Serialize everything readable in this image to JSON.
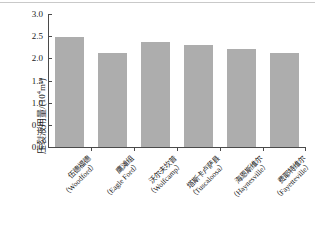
{
  "chart_data": {
    "type": "bar",
    "title": "",
    "xlabel": "",
    "ylabel": "压裂液用量/(10⁴m³)",
    "ylabel_main": "压裂液用量/(10",
    "ylabel_sup": "4",
    "ylabel_tail": "m³)",
    "ylim": [
      0.0,
      3.0
    ],
    "ytick_labels": [
      "0.0",
      "0.5",
      "1.0",
      "1.5",
      "2.0",
      "2.5",
      "3.0"
    ],
    "ytick_values": [
      0.0,
      0.5,
      1.0,
      1.5,
      2.0,
      2.5,
      3.0
    ],
    "grid": false,
    "legend": "none",
    "bar_color": "#adadad",
    "axis_color": "#4a4a4a",
    "categories": [
      "伍德福德（Woodford）",
      "鹰滩组（Eagle Ford）",
      "沃尔夫坎普（Wolfcamp）",
      "塔斯卡卢萨县（Tuscaloosa）",
      "海恩斯维尔（Haynesville）",
      "费耶特维尔（Fayetteville）"
    ],
    "categories_cn": [
      "伍德福德",
      "鹰滩组",
      "沃尔夫坎普",
      "塔斯卡卢萨县",
      "海恩斯维尔",
      "费耶特维尔"
    ],
    "categories_en": [
      "（Woodford）",
      "（Eagle Ford）",
      "（Wolfcamp）",
      "（Tuscaloosa）",
      "（Haynesville）",
      "（Fayetteville）"
    ],
    "values": [
      2.49,
      2.12,
      2.38,
      2.3,
      2.22,
      2.12
    ]
  }
}
